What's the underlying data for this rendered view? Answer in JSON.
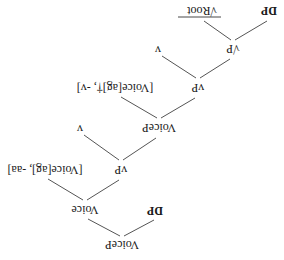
{
  "diagram": {
    "type": "syntax-tree",
    "orientation": "rotated-180",
    "nodes": {
      "root_voicep": "VoiceP",
      "spec_dp": "DP",
      "voice_head": "Voice",
      "lower_vp": "vP",
      "voice_features": "[Voice[ag], -aa]",
      "mid_voicep": "VoiceP",
      "lower_v": "v",
      "upper_vp": "vP",
      "voice_features_dagger": "[Voice[ag]†, -v]",
      "root_p": "√P",
      "upper_v": "v",
      "complement_dp": "DP",
      "root": "√Root"
    },
    "edges": [
      [
        "VoiceP",
        "DP"
      ],
      [
        "VoiceP",
        "Voice"
      ],
      [
        "Voice",
        "vP"
      ],
      [
        "Voice",
        "[Voice[ag], -aa]"
      ],
      [
        "vP",
        "VoiceP"
      ],
      [
        "vP",
        "v"
      ],
      [
        "VoiceP",
        "vP"
      ],
      [
        "VoiceP",
        "[Voice[ag]†, -v]"
      ],
      [
        "vP",
        "√P"
      ],
      [
        "vP",
        "v"
      ],
      [
        "√P",
        "DP"
      ],
      [
        "√P",
        "√Root"
      ]
    ]
  }
}
